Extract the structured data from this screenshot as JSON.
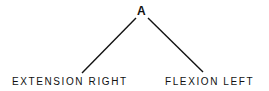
{
  "diagram": {
    "type": "tree",
    "root": {
      "label": "A"
    },
    "children": [
      {
        "label": "EXTENSION RIGHT"
      },
      {
        "label": "FLEXION LEFT"
      }
    ],
    "colors": {
      "line": "#111111",
      "text": "#111111",
      "background": "#ffffff"
    }
  }
}
